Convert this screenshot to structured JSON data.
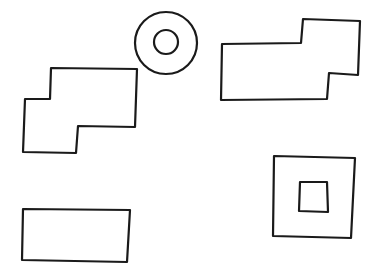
{
  "canvas": {
    "width": 373,
    "height": 279,
    "background": "#ffffff",
    "stroke": "#1a1a1a",
    "stroke_width": 2.2
  },
  "shapes": [
    {
      "id": "ring",
      "type": "annulus",
      "outer": {
        "cx": 166,
        "cy": 43,
        "r": 31
      },
      "inner": {
        "cx": 166,
        "cy": 42,
        "r": 12
      }
    },
    {
      "id": "left-stepped-polygon",
      "type": "polygon",
      "points": [
        [
          51,
          68
        ],
        [
          137,
          69
        ],
        [
          135,
          127
        ],
        [
          78,
          126
        ],
        [
          76,
          153
        ],
        [
          23,
          152
        ],
        [
          25,
          99
        ],
        [
          50,
          99
        ]
      ]
    },
    {
      "id": "right-stepped-polygon",
      "type": "polygon",
      "points": [
        [
          222,
          44
        ],
        [
          301,
          43
        ],
        [
          303,
          19
        ],
        [
          360,
          21
        ],
        [
          358,
          75
        ],
        [
          329,
          73
        ],
        [
          327,
          99
        ],
        [
          221,
          100
        ]
      ]
    },
    {
      "id": "bottom-left-rectangle",
      "type": "polygon",
      "points": [
        [
          23,
          209
        ],
        [
          130,
          210
        ],
        [
          127,
          262
        ],
        [
          22,
          260
        ]
      ]
    },
    {
      "id": "nested-square-outer",
      "type": "polygon",
      "points": [
        [
          274,
          156
        ],
        [
          355,
          158
        ],
        [
          351,
          238
        ],
        [
          273,
          236
        ]
      ]
    },
    {
      "id": "nested-square-inner",
      "type": "polygon",
      "points": [
        [
          300,
          182
        ],
        [
          327,
          182
        ],
        [
          328,
          212
        ],
        [
          299,
          211
        ]
      ]
    }
  ]
}
